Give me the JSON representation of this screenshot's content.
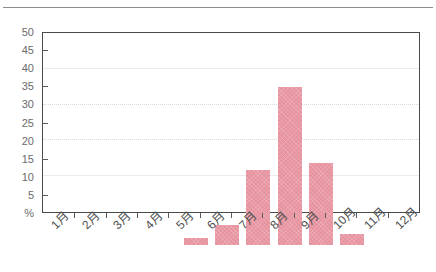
{
  "chart_data": {
    "type": "bar",
    "title": "",
    "subtitle": "",
    "xlabel": "",
    "ylabel": "%",
    "categories": [
      "1月",
      "2月",
      "3月",
      "4月",
      "5月",
      "6月",
      "7月",
      "8月",
      "9月",
      "10月",
      "11月",
      "12月"
    ],
    "values": [
      0,
      0,
      0,
      2,
      5.5,
      21,
      44,
      23,
      3,
      0,
      0,
      0
    ],
    "ylim": [
      0,
      50
    ],
    "y_ticks": [
      0,
      5,
      10,
      15,
      20,
      25,
      30,
      35,
      40,
      45,
      50
    ],
    "y_tick_labels": [
      "%",
      "5",
      "10",
      "15",
      "20",
      "25",
      "30",
      "35",
      "40",
      "45",
      "50"
    ],
    "grid": {
      "horizontal": true,
      "at": [
        10,
        20,
        30,
        40
      ],
      "vertical": false
    },
    "legend": {
      "present": false,
      "position": ""
    },
    "series": [
      {
        "name": "",
        "color": "#E7939F",
        "values": [
          0,
          0,
          0,
          2,
          5.5,
          21,
          44,
          23,
          3,
          0,
          0,
          0
        ]
      }
    ],
    "annotations": []
  },
  "colors": {
    "bar": "#E7939F",
    "axis": "#4A4A4A",
    "gridline": "#ECEAEA",
    "tick_label": "#6B6B6B",
    "month_label": "#4F4F4F",
    "top_rule": "#8D8D8D",
    "background": "#FFFFFF"
  }
}
